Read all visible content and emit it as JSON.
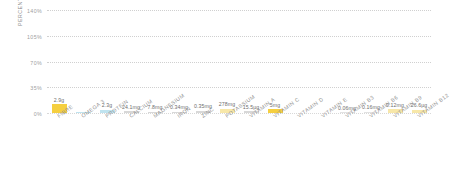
{
  "chart_data": {
    "type": "bar",
    "title": "",
    "subtitle": "",
    "xlabel": "",
    "ylabel": "PERCENTAGE OF RDA",
    "ylim": [
      0,
      140
    ],
    "yticks": [
      "0%",
      "35%",
      "70%",
      "105%",
      "140%"
    ],
    "ytick_values": [
      0,
      35,
      70,
      105,
      140
    ],
    "grid": true,
    "legend": false,
    "categories": [
      "FIBRE",
      "OMEGA 3",
      "PROTEIN",
      "CALCIUM",
      "MAGNESIUM",
      "IRON",
      "ZINC",
      "POTASSIUM",
      "VITAMIN A",
      "VITAMIN C",
      "VITAMIN D",
      "VITAMIN E",
      "VITAMIN B3",
      "VITAMIN B6",
      "VITAMIN B9",
      "VITAMIN B12"
    ],
    "values": [
      11.6,
      2.0,
      4.6,
      2.4,
      2.0,
      1.9,
      3.2,
      5.9,
      2.4,
      5.0,
      0,
      1.2,
      1.2,
      1.4,
      5.2,
      4.6
    ],
    "data_labels": [
      "2.9g",
      "",
      "2.3g",
      "24.1mg",
      "7.8mg",
      "0.34mg",
      "0.35mg",
      "278mg",
      "15.5µg",
      "5mg",
      "",
      "",
      "0.06mg",
      "0.16mg",
      "0.12mg",
      "26.6µg"
    ],
    "bar_colors": [
      "#f5cf3f",
      "#bfe3ef",
      "#bfe3ef",
      "#d8d8d8",
      "#d8d8d8",
      "#d8d8d8",
      "#d8d8d8",
      "#f7e7a8",
      "#d8d8d8",
      "#f5cf3f",
      "#ffffff",
      "#ffffff",
      "#e2e2e2",
      "#e2e2e2",
      "#f7e7a8",
      "#f7e7a8"
    ],
    "axis_color": "#d0d0d0",
    "label_color": "#8e8e8e",
    "value_color": "#6e6e6e"
  }
}
